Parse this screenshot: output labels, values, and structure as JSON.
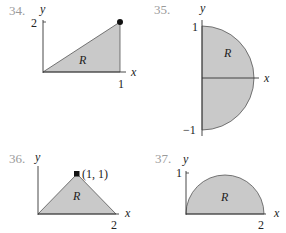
{
  "colors": {
    "region_fill": "#c9c9c9",
    "axis": "#333333",
    "edge": "#555555",
    "problem_number": "#9a9a9a",
    "text": "#222222"
  },
  "figures": [
    {
      "number": "34.",
      "y_axis_label": "y",
      "x_axis_label": "x",
      "y_tick": "2",
      "x_tick": "1",
      "region_label": "R",
      "description": "Triangle with vertices (0,0), (1,2), (1,0)"
    },
    {
      "number": "35.",
      "y_axis_label": "y",
      "x_axis_label": "x",
      "y_tick_top": "1",
      "y_tick_bottom": "−1",
      "region_label": "R",
      "description": "Right half of unit disk"
    },
    {
      "number": "36.",
      "y_axis_label": "y",
      "x_axis_label": "x",
      "point_label": "(1, 1)",
      "x_tick": "2",
      "region_label": "R",
      "description": "Triangle with vertices (0,0), (1,1), (2,0)"
    },
    {
      "number": "37.",
      "y_axis_label": "y",
      "x_axis_label": "x",
      "y_tick": "1",
      "x_tick": "2",
      "region_label": "R",
      "description": "Upper half of disk centered at (1,0) with radius 1"
    }
  ]
}
